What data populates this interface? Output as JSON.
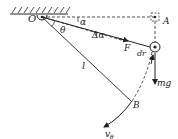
{
  "diagram": {
    "labels": {
      "pivot": "O",
      "alpha": "α",
      "d_alpha": "Δα",
      "theta": "θ",
      "point_A": "A",
      "force": "F",
      "dr": "dr",
      "length": "l",
      "weight": "mg",
      "point_B": "B",
      "velocity": "v",
      "velocity_sub": "θ"
    },
    "colors": {
      "stroke": "#222222",
      "background": "#ffffff"
    }
  }
}
